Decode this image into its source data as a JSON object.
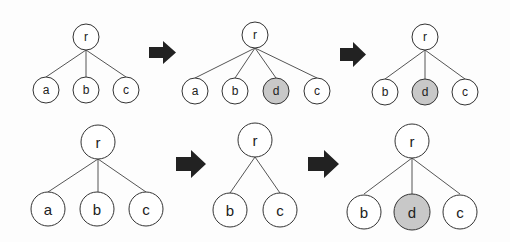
{
  "diagram": {
    "highlight_color": "#c8c8c8",
    "rows": [
      {
        "name": "top-row",
        "trees": [
          {
            "root": "r",
            "children": [
              "a",
              "b",
              "c"
            ],
            "highlighted": []
          },
          {
            "root": "r",
            "children": [
              "a",
              "b",
              "d",
              "c"
            ],
            "highlighted": [
              "d"
            ]
          },
          {
            "root": "r",
            "children": [
              "b",
              "d",
              "c"
            ],
            "highlighted": [
              "d"
            ]
          }
        ]
      },
      {
        "name": "bottom-row",
        "trees": [
          {
            "root": "r",
            "children": [
              "a",
              "b",
              "c"
            ],
            "highlighted": []
          },
          {
            "root": "r",
            "children": [
              "b",
              "c"
            ],
            "highlighted": []
          },
          {
            "root": "r",
            "children": [
              "b",
              "d",
              "c"
            ],
            "highlighted": [
              "d"
            ]
          }
        ]
      }
    ],
    "arrows": [
      "right-arrow",
      "right-arrow",
      "right-arrow",
      "right-arrow"
    ]
  },
  "labels": {
    "t1": {
      "r": "r",
      "a": "a",
      "b": "b",
      "c": "c"
    },
    "t2": {
      "r": "r",
      "a": "a",
      "b": "b",
      "d": "d",
      "c": "c"
    },
    "t3": {
      "r": "r",
      "b": "b",
      "d": "d",
      "c": "c"
    },
    "t4": {
      "r": "r",
      "a": "a",
      "b": "b",
      "c": "c"
    },
    "t5": {
      "r": "r",
      "b": "b",
      "c": "c"
    },
    "t6": {
      "r": "r",
      "b": "b",
      "d": "d",
      "c": "c"
    }
  }
}
